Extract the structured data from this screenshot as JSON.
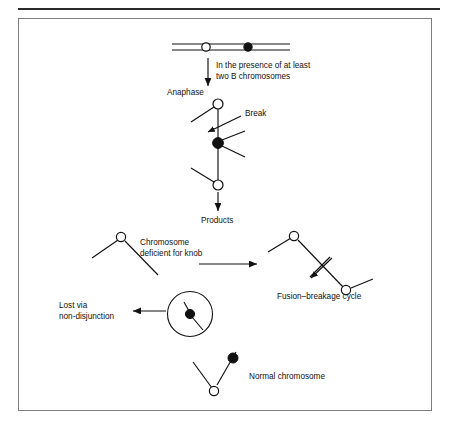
{
  "figure": {
    "frame": {
      "border_color": "#7d7d7d",
      "rule_color": "#2b2b2b",
      "background": "#ffffff"
    },
    "ink_color": "#111111"
  },
  "labels": {
    "condition": {
      "line1": "In the presence of at least",
      "line2": "two B chromosomes"
    },
    "anaphase": "Anaphase",
    "break": "Break",
    "products": "Products",
    "deficient": {
      "line1": "Chromosome",
      "line2": "deficient for knob"
    },
    "fusion_breakage": "Fusion–breakage cycle",
    "lost": {
      "line1": "Lost via",
      "line2": "non-disjunction"
    },
    "normal_chromosome": "Normal chromosome"
  },
  "markers": {
    "knob_open_name": "knob-open-circle",
    "centromere_filled_name": "centromere-filled-circle",
    "micronucleus_name": "micronucleus-circle"
  },
  "stages": [
    {
      "id": "parent-chromosome",
      "caption": "",
      "knobs": 1,
      "centromeres": 1
    },
    {
      "id": "anaphase-bridge",
      "caption": "Anaphase",
      "knobs": 2,
      "centromeres": 1
    },
    {
      "id": "knob-deficient-chromosome",
      "caption": "Chromosome deficient for knob",
      "knobs": 1,
      "centromeres": 0
    },
    {
      "id": "fusion-breakage-chromosome",
      "caption": "Fusion–breakage cycle",
      "knobs": 2,
      "centromeres": 0
    },
    {
      "id": "micronucleus-chromosome",
      "caption": "Lost via non-disjunction",
      "knobs": 0,
      "centromeres": 1
    },
    {
      "id": "normal-chromosome",
      "caption": "Normal chromosome",
      "knobs": 1,
      "centromeres": 1
    }
  ]
}
